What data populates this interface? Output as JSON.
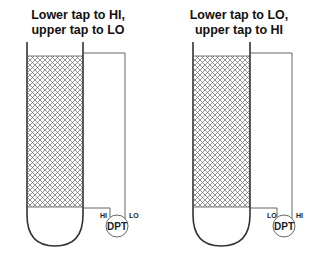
{
  "diagrams": [
    {
      "title": "Lower tap to HI,\nupper tap to LO",
      "lower_tap_label": "HI",
      "upper_tap_label": "LO",
      "instrument_label": "DPT"
    },
    {
      "title": "Lower tap to LO,\nupper tap to HI",
      "lower_tap_label": "LO",
      "upper_tap_label": "HI",
      "instrument_label": "DPT"
    }
  ],
  "colors": {
    "line": "#333333",
    "hatch": "#555555",
    "text": "#111111"
  }
}
